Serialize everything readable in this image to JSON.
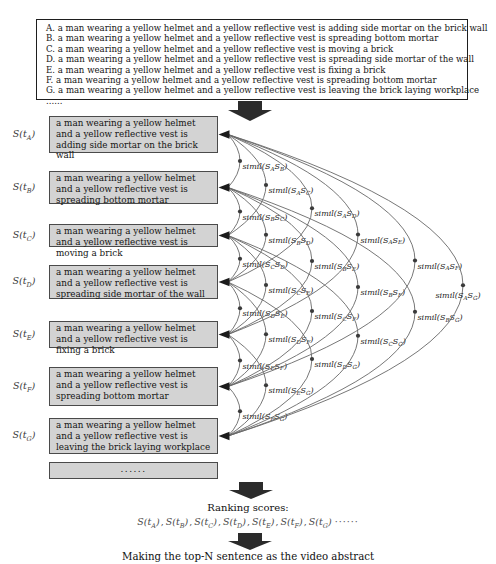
{
  "top_box": {
    "lines": [
      "A. a man wearing a yellow helmet and a yellow reflective vest is adding side mortar on the brick wall",
      "B. a man wearing a yellow helmet and a yellow reflective vest is spreading bottom mortar",
      "C. a man wearing a yellow helmet and a yellow reflective vest is moving a brick",
      "D. a man wearing a yellow helmet and a yellow reflective vest is spreading side mortar of the wall",
      "E. a man wearing a yellow helmet and a yellow reflective vest is fixing a brick",
      "F. a man wearing a yellow helmet and a yellow reflective vest is spreading bottom mortar",
      "G. a man wearing a yellow helmet and a yellow reflective vest is leaving the brick laying workplace",
      "......"
    ]
  },
  "score_symbol": "S(t",
  "sentences": [
    {
      "id": "A",
      "text": "a man wearing a yellow helmet and a yellow reflective vest is adding side mortar on the brick wall"
    },
    {
      "id": "B",
      "text": "a man wearing a yellow helmet and a yellow reflective vest is spreading bottom mortar"
    },
    {
      "id": "C",
      "text": "a man wearing a yellow helmet and a yellow reflective vest is moving a brick"
    },
    {
      "id": "D",
      "text": "a man wearing a yellow helmet and a yellow reflective vest is spreading side mortar of the wall"
    },
    {
      "id": "E",
      "text": "a man wearing a yellow helmet and a yellow reflective vest is fixing a brick"
    },
    {
      "id": "F",
      "text": "a man wearing a yellow helmet and a yellow reflective vest is spreading bottom mortar"
    },
    {
      "id": "G",
      "text": "a man wearing a yellow helmet and a yellow reflective vest is leaving the brick laying workplace"
    }
  ],
  "ellipsis_box_text": "......",
  "similarity": {
    "function_name": "simil",
    "pairs": [
      {
        "a": "A",
        "b": "B"
      },
      {
        "a": "B",
        "b": "C"
      },
      {
        "a": "C",
        "b": "D"
      },
      {
        "a": "D",
        "b": "E"
      },
      {
        "a": "E",
        "b": "F"
      },
      {
        "a": "F",
        "b": "G"
      },
      {
        "a": "A",
        "b": "C"
      },
      {
        "a": "B",
        "b": "D"
      },
      {
        "a": "C",
        "b": "E"
      },
      {
        "a": "D",
        "b": "F"
      },
      {
        "a": "E",
        "b": "G"
      },
      {
        "a": "A",
        "b": "D"
      },
      {
        "a": "B",
        "b": "E"
      },
      {
        "a": "C",
        "b": "F"
      },
      {
        "a": "D",
        "b": "G"
      },
      {
        "a": "A",
        "b": "E"
      },
      {
        "a": "B",
        "b": "F"
      },
      {
        "a": "C",
        "b": "G"
      },
      {
        "a": "A",
        "b": "F"
      },
      {
        "a": "B",
        "b": "G"
      },
      {
        "a": "A",
        "b": "G"
      }
    ]
  },
  "ranking": {
    "title": "Ranking scores:",
    "item_ids": [
      "A",
      "B",
      "C",
      "D",
      "E",
      "F",
      "G"
    ],
    "separator": ",",
    "trailing": "······"
  },
  "caption": "Making the top-N sentence as the video abstract",
  "colors": {
    "box_fill": "#d3d3d3",
    "box_border": "#4a4a4a",
    "arc": "#686868",
    "dot": "#3a3a3a",
    "simil_label": "#222222",
    "arrow": "#2b2b2b"
  }
}
